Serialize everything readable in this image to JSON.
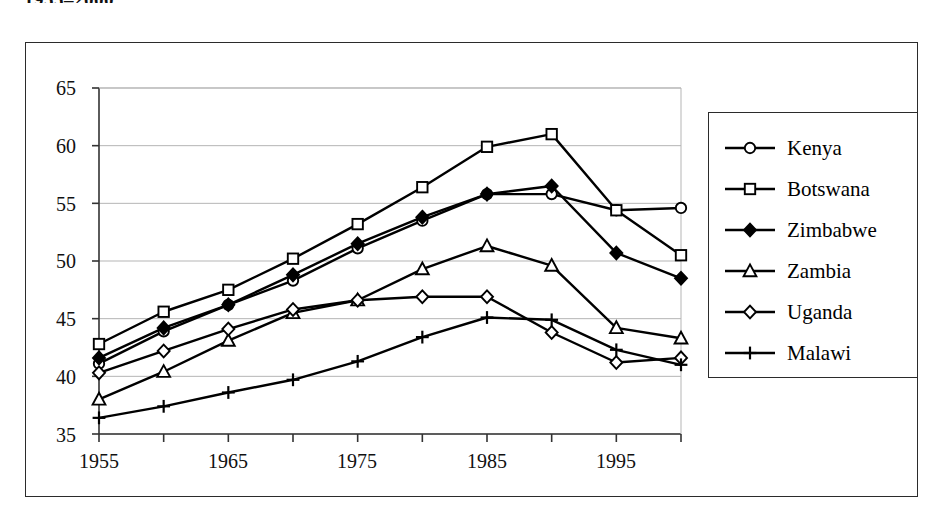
{
  "document": {
    "title_fragment": "1955–2000"
  },
  "chart_data": {
    "type": "line",
    "title": "",
    "subtitle": "",
    "xlabel": "",
    "ylabel": "",
    "xlim": [
      1955,
      2000
    ],
    "ylim": [
      35,
      65
    ],
    "yticks": [
      35,
      40,
      45,
      50,
      55,
      60,
      65
    ],
    "xticks": [
      1955,
      1960,
      1965,
      1970,
      1975,
      1980,
      1985,
      1990,
      1995,
      2000
    ],
    "xtick_labels_shown": [
      "1955",
      "1965",
      "1975",
      "1985",
      "1995"
    ],
    "grid": "horizontal",
    "legend_position": "right-outside",
    "x": [
      1955,
      1960,
      1965,
      1970,
      1975,
      1980,
      1985,
      1990,
      1995,
      2000
    ],
    "series": [
      {
        "name": "Kenya",
        "marker": "open-circle",
        "values": [
          41.1,
          43.9,
          46.2,
          48.3,
          51.1,
          53.5,
          55.8,
          55.8,
          54.4,
          54.6
        ]
      },
      {
        "name": "Botswana",
        "marker": "open-square",
        "values": [
          42.8,
          45.6,
          47.5,
          50.2,
          53.2,
          56.4,
          59.9,
          61.0,
          54.4,
          50.5
        ]
      },
      {
        "name": "Zimbabwe",
        "marker": "filled-diamond",
        "values": [
          41.6,
          44.2,
          46.2,
          48.8,
          51.5,
          53.8,
          55.8,
          56.5,
          50.7,
          48.5
        ]
      },
      {
        "name": "Zambia",
        "marker": "open-triangle",
        "values": [
          38.0,
          40.4,
          43.1,
          45.5,
          46.6,
          49.3,
          51.3,
          49.6,
          44.2,
          43.3
        ]
      },
      {
        "name": "Uganda",
        "marker": "open-diamond",
        "values": [
          40.3,
          42.2,
          44.1,
          45.8,
          46.6,
          46.9,
          46.9,
          43.8,
          41.2,
          41.6
        ]
      },
      {
        "name": "Malawi",
        "marker": "plus",
        "values": [
          36.4,
          37.4,
          38.6,
          39.7,
          41.3,
          43.4,
          45.1,
          44.9,
          42.3,
          41.0
        ]
      }
    ]
  },
  "axes": {
    "y_labels": [
      "65",
      "60",
      "55",
      "50",
      "45",
      "40",
      "35"
    ],
    "x_labels": [
      "1955",
      "1965",
      "1975",
      "1985",
      "1995"
    ]
  },
  "legend": {
    "items": [
      {
        "label": "Kenya",
        "marker": "open-circle"
      },
      {
        "label": "Botswana",
        "marker": "open-square"
      },
      {
        "label": "Zimbabwe",
        "marker": "filled-diamond"
      },
      {
        "label": "Zambia",
        "marker": "open-triangle"
      },
      {
        "label": "Uganda",
        "marker": "open-diamond"
      },
      {
        "label": "Malawi",
        "marker": "plus"
      }
    ]
  },
  "colors": {
    "line": "#000000",
    "marker_fill": "#ffffff",
    "marker_fill_solid": "#000000",
    "grid": "#b5b5b5",
    "axis": "#333333",
    "frame": "#2b2b2b",
    "background": "#ffffff"
  }
}
